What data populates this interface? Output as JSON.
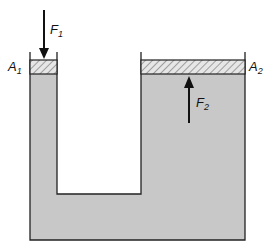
{
  "diagram": {
    "type": "hydraulic-press",
    "colors": {
      "fluid": "#c8c8c8",
      "outline": "#222222",
      "background": "#ffffff",
      "piston_hatch": "#555555"
    },
    "labels": {
      "f1": {
        "main": "F",
        "sub": "1"
      },
      "f2": {
        "main": "F",
        "sub": "2"
      },
      "a1": {
        "main": "A",
        "sub": "1"
      },
      "a2": {
        "main": "A",
        "sub": "2"
      }
    },
    "arrows": {
      "f1_direction": "down",
      "f2_direction": "up"
    }
  }
}
